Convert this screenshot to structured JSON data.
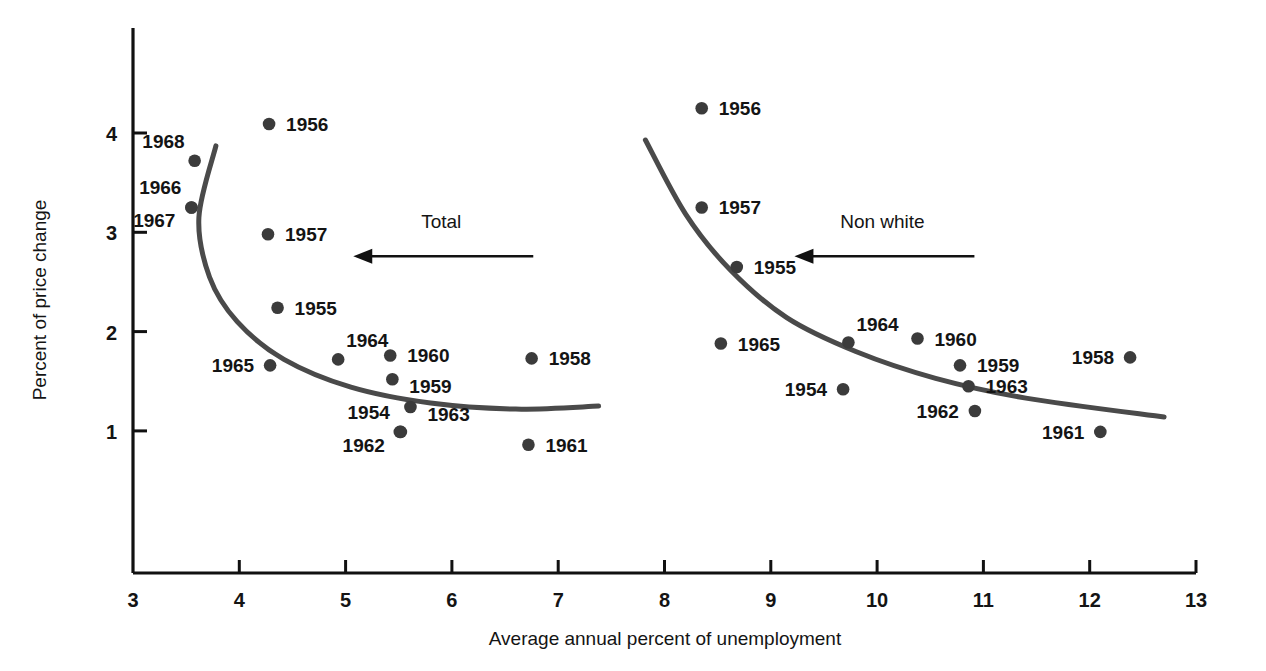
{
  "chart_data": {
    "type": "scatter",
    "title": "",
    "xlabel": "Average annual percent of unemployment",
    "ylabel": "Percent of price change",
    "xlim": [
      3,
      13
    ],
    "ylim": [
      0,
      4.65
    ],
    "xticks": [
      "3",
      "4",
      "5",
      "6",
      "7",
      "8",
      "9",
      "10",
      "11",
      "12",
      "13"
    ],
    "xtick_values": [
      3,
      4,
      5,
      6,
      7,
      8,
      9,
      10,
      11,
      12,
      13
    ],
    "yticks": [
      "1",
      "2",
      "3",
      "4"
    ],
    "ytick_values": [
      1,
      2,
      3,
      4
    ],
    "grid": false,
    "legend_position": "inline-annotations",
    "annotations": [
      {
        "name": "total-arrow-label",
        "text": "Total",
        "x": 5.9,
        "y": 3.0,
        "arrow": "left"
      },
      {
        "name": "nonwhite-arrow-label",
        "text": "Non white",
        "x": 10.05,
        "y": 3.0,
        "arrow": "left"
      }
    ],
    "series": [
      {
        "name": "Total",
        "curve_label": "Total",
        "points": [
          {
            "label": "1954",
            "x": 5.51,
            "y": 0.99,
            "label_pos": "left-up"
          },
          {
            "label": "1955",
            "x": 4.36,
            "y": 2.24,
            "label_pos": "right"
          },
          {
            "label": "1956",
            "x": 4.28,
            "y": 4.09,
            "label_pos": "right"
          },
          {
            "label": "1957",
            "x": 4.27,
            "y": 2.98,
            "label_pos": "right"
          },
          {
            "label": "1958",
            "x": 6.75,
            "y": 1.73,
            "label_pos": "right"
          },
          {
            "label": "1959",
            "x": 5.44,
            "y": 1.52,
            "label_pos": "right-down"
          },
          {
            "label": "1960",
            "x": 5.42,
            "y": 1.76,
            "label_pos": "right"
          },
          {
            "label": "1961",
            "x": 6.72,
            "y": 0.86,
            "label_pos": "right"
          },
          {
            "label": "1962",
            "x": 5.52,
            "y": 0.99,
            "label_pos": "left-down"
          },
          {
            "label": "1963",
            "x": 5.61,
            "y": 1.24,
            "label_pos": "right-down"
          },
          {
            "label": "1964",
            "x": 4.93,
            "y": 1.72,
            "label_pos": "right-up"
          },
          {
            "label": "1965",
            "x": 4.29,
            "y": 1.66,
            "label_pos": "left"
          },
          {
            "label": "1966",
            "x": 3.55,
            "y": 3.25,
            "label_pos": "left-up"
          },
          {
            "label": "1967",
            "x": 3.55,
            "y": 3.25,
            "label_pos": "left-down"
          },
          {
            "label": "1968",
            "x": 3.58,
            "y": 3.72,
            "label_pos": "left-up"
          }
        ],
        "fit_curve": {
          "description": "Backward-bending Phillips curve for Total",
          "points": [
            {
              "x": 3.78,
              "y": 3.87
            },
            {
              "x": 3.62,
              "y": 3.15
            },
            {
              "x": 3.72,
              "y": 2.55
            },
            {
              "x": 3.98,
              "y": 2.1
            },
            {
              "x": 4.42,
              "y": 1.72
            },
            {
              "x": 5.05,
              "y": 1.44
            },
            {
              "x": 5.8,
              "y": 1.28
            },
            {
              "x": 6.6,
              "y": 1.22
            },
            {
              "x": 7.38,
              "y": 1.25
            }
          ]
        }
      },
      {
        "name": "Non white",
        "curve_label": "Non white",
        "points": [
          {
            "label": "1954",
            "x": 9.68,
            "y": 1.42,
            "label_pos": "left"
          },
          {
            "label": "1955",
            "x": 8.68,
            "y": 2.65,
            "label_pos": "right"
          },
          {
            "label": "1956",
            "x": 8.35,
            "y": 4.25,
            "label_pos": "right"
          },
          {
            "label": "1957",
            "x": 8.35,
            "y": 3.25,
            "label_pos": "right"
          },
          {
            "label": "1958",
            "x": 12.38,
            "y": 1.74,
            "label_pos": "left"
          },
          {
            "label": "1959",
            "x": 10.78,
            "y": 1.66,
            "label_pos": "right"
          },
          {
            "label": "1960",
            "x": 10.38,
            "y": 1.93,
            "label_pos": "right"
          },
          {
            "label": "1961",
            "x": 12.1,
            "y": 0.99,
            "label_pos": "left"
          },
          {
            "label": "1962",
            "x": 10.92,
            "y": 1.2,
            "label_pos": "left"
          },
          {
            "label": "1963",
            "x": 10.86,
            "y": 1.45,
            "label_pos": "right"
          },
          {
            "label": "1964",
            "x": 9.73,
            "y": 1.89,
            "label_pos": "right-up"
          },
          {
            "label": "1965",
            "x": 8.53,
            "y": 1.88,
            "label_pos": "right"
          }
        ],
        "fit_curve": {
          "description": "Downward-sloping Phillips curve for Non white",
          "points": [
            {
              "x": 7.82,
              "y": 3.93
            },
            {
              "x": 8.2,
              "y": 3.18
            },
            {
              "x": 8.62,
              "y": 2.62
            },
            {
              "x": 9.15,
              "y": 2.14
            },
            {
              "x": 9.8,
              "y": 1.8
            },
            {
              "x": 10.55,
              "y": 1.53
            },
            {
              "x": 11.4,
              "y": 1.33
            },
            {
              "x": 12.7,
              "y": 1.14
            }
          ]
        }
      }
    ]
  },
  "style": {
    "point_color": "#3b3b3b",
    "curve_color": "#4a4a4a",
    "axis_color": "#111111",
    "text_color": "#141414",
    "background": "#ffffff"
  }
}
